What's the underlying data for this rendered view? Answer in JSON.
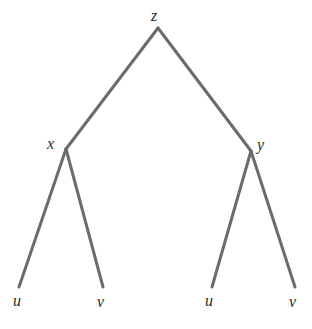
{
  "figure": {
    "kind": "binary-tree-diagram",
    "background_color": "#ffffff",
    "edge_color": "#6b6b6b",
    "edge_width": 3,
    "label_color": "#2b2b2b",
    "width": 312,
    "height": 329
  },
  "nodes": {
    "root": {
      "id": "z",
      "label": "z",
      "x": 158,
      "y": 28
    },
    "left_internal": {
      "id": "x",
      "label": "x",
      "x": 66,
      "y": 149
    },
    "right_internal": {
      "id": "y",
      "label": "y",
      "x": 251,
      "y": 151
    },
    "leaf_left_u": {
      "id": "u1",
      "label": "u",
      "x": 19,
      "y": 287
    },
    "leaf_left_v": {
      "id": "v1",
      "label": "v",
      "x": 103,
      "y": 287
    },
    "leaf_right_u": {
      "id": "u2",
      "label": "u",
      "x": 212,
      "y": 287
    },
    "leaf_right_v": {
      "id": "v2",
      "label": "v",
      "x": 295,
      "y": 287
    }
  },
  "edges": [
    {
      "name": "z-to-x",
      "from": "z",
      "to": "x",
      "x1": 158,
      "y1": 28,
      "x2": 66,
      "y2": 149
    },
    {
      "name": "z-to-y",
      "from": "z",
      "to": "y",
      "x1": 158,
      "y1": 28,
      "x2": 251,
      "y2": 151
    },
    {
      "name": "x-to-u",
      "from": "x",
      "to": "u1",
      "x1": 66,
      "y1": 149,
      "x2": 19,
      "y2": 287
    },
    {
      "name": "x-to-v",
      "from": "x",
      "to": "v1",
      "x1": 66,
      "y1": 149,
      "x2": 103,
      "y2": 287
    },
    {
      "name": "y-to-u",
      "from": "y",
      "to": "u2",
      "x1": 251,
      "y1": 151,
      "x2": 212,
      "y2": 287
    },
    {
      "name": "y-to-v",
      "from": "y",
      "to": "v2",
      "x1": 251,
      "y1": 151,
      "x2": 295,
      "y2": 287
    }
  ],
  "labels": {
    "root": "z",
    "left_internal": "x",
    "right_internal": "y",
    "leaf_left_u": "u",
    "leaf_left_v": "v",
    "leaf_right_u": "u",
    "leaf_right_v": "v"
  }
}
